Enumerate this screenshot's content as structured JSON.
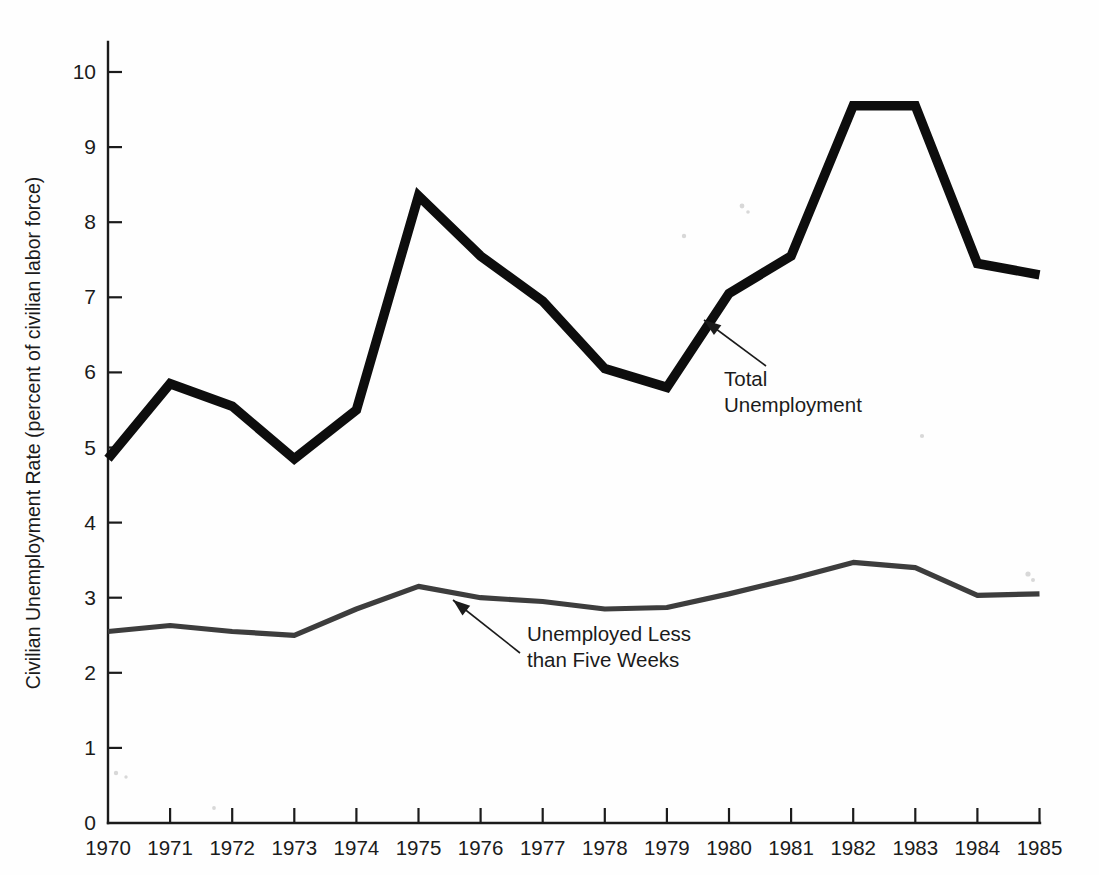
{
  "chart_data": {
    "type": "line",
    "title": "",
    "xlabel": "",
    "ylabel": "Civilian Unemployment Rate (percent of civilian labor force)",
    "x": [
      1970,
      1971,
      1972,
      1973,
      1974,
      1975,
      1976,
      1977,
      1978,
      1979,
      1980,
      1981,
      1982,
      1983,
      1984,
      1985
    ],
    "categories": [
      "1970",
      "1971",
      "1972",
      "1973",
      "1974",
      "1975",
      "1976",
      "1977",
      "1978",
      "1979",
      "1980",
      "1981",
      "1982",
      "1983",
      "1984",
      "1985"
    ],
    "xlim": [
      1970,
      1985
    ],
    "ylim": [
      0,
      10.6
    ],
    "yticks": [
      0,
      1,
      2,
      3,
      4,
      5,
      6,
      7,
      8,
      9,
      10
    ],
    "ytick_labels": [
      "0",
      "1",
      "2",
      "3",
      "4",
      "5",
      "6",
      "7",
      "8",
      "9",
      "10"
    ],
    "grid": false,
    "legend_position": "inline-annotations",
    "series": [
      {
        "name": "Total Unemployment",
        "color": "#0d0d0d",
        "values": [
          4.85,
          5.85,
          5.55,
          4.85,
          5.5,
          8.35,
          7.55,
          6.95,
          6.05,
          5.8,
          7.05,
          7.55,
          9.55,
          9.55,
          7.45,
          7.3
        ]
      },
      {
        "name": "Unemployed Less than Five Weeks",
        "color": "#3d3d3d",
        "values": [
          2.55,
          2.63,
          2.55,
          2.5,
          2.85,
          3.15,
          3.0,
          2.95,
          2.85,
          2.87,
          3.05,
          3.25,
          3.47,
          3.4,
          3.03,
          3.05
        ]
      }
    ],
    "annotations": [
      {
        "id": "total-unemployment",
        "lines": [
          "Total",
          "Unemployment"
        ],
        "text_x": 724,
        "text_y": 386,
        "arrow_from_x": 766,
        "arrow_from_y": 366,
        "arrow_to_x": 704,
        "arrow_to_y": 320
      },
      {
        "id": "unemployed-less-than-five-weeks",
        "lines": [
          "Unemployed Less",
          "than Five Weeks"
        ],
        "text_x": 527,
        "text_y": 641,
        "arrow_from_x": 520,
        "arrow_from_y": 653,
        "arrow_to_x": 453,
        "arrow_to_y": 600
      }
    ]
  },
  "figure": {
    "plot_left": 108,
    "plot_right": 1040,
    "plot_baseline_y": 823,
    "plot_top_y": 42,
    "px_per_unit": 75.1,
    "year_spacing_px": 62.1,
    "axis_color": "#1b1b1b",
    "background_color": "#fefefe"
  }
}
